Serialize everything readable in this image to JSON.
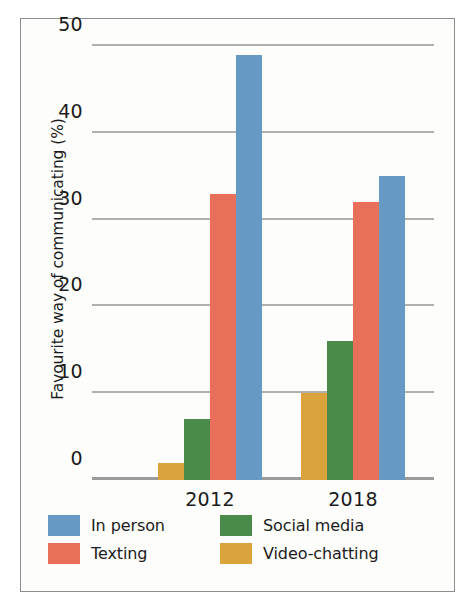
{
  "chart_data": {
    "type": "bar",
    "title": "",
    "xlabel": "",
    "ylabel": "Favourite way of communicating (%)",
    "categories": [
      "2012",
      "2018"
    ],
    "series": [
      {
        "name": "Video-chatting",
        "color": "#dba33c",
        "values": [
          2,
          10
        ]
      },
      {
        "name": "Social media",
        "color": "#4a8b4a",
        "values": [
          7,
          16
        ]
      },
      {
        "name": "Texting",
        "color": "#e8705a",
        "values": [
          33,
          32
        ]
      },
      {
        "name": "In person",
        "color": "#6699c4",
        "values": [
          49,
          35
        ]
      }
    ],
    "ylim": [
      0,
      50
    ],
    "yticks": [
      "0",
      "10",
      "20",
      "30",
      "40",
      "50"
    ],
    "ytick_values": [
      0,
      10,
      20,
      30,
      40,
      50
    ],
    "grid": true,
    "legend_position": "bottom",
    "legend_order": [
      "In person",
      "Social media",
      "Texting",
      "Video-chatting"
    ],
    "colors": {
      "in_person": "#6699c4",
      "social_media": "#4a8b4a",
      "texting": "#e8705a",
      "video_chatting": "#dba33c",
      "gridline": "#b0b0b0",
      "axis_text": "#1b1b1b",
      "frame": "#8d8d8d",
      "plot_background": "#fdfdfb"
    }
  },
  "legend": [
    {
      "label": "In person",
      "color": "#6699c4"
    },
    {
      "label": "Social media",
      "color": "#4a8b4a"
    },
    {
      "label": "Texting",
      "color": "#e8705a"
    },
    {
      "label": "Video-chatting",
      "color": "#dba33c"
    }
  ]
}
